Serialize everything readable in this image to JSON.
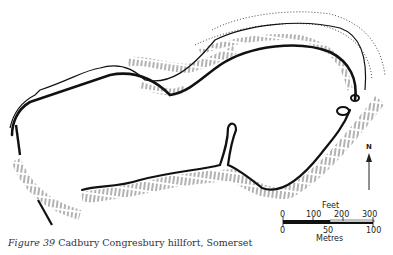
{
  "figure": {
    "label": "Figure 39",
    "title": "Cadbury Congresbury hillfort, Somerset"
  },
  "north_arrow": {
    "label": "N"
  },
  "scale_bar": {
    "feet_label": "Feet",
    "feet_ticks": [
      "0",
      "100",
      "200",
      "300"
    ],
    "metres_label": "Metres",
    "metres_ticks": [
      "0",
      "50",
      "100"
    ]
  },
  "colors": {
    "ink": "#111111",
    "paper": "#ffffff"
  }
}
